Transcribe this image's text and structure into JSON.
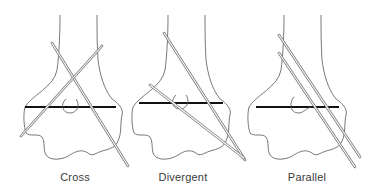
{
  "panels": [
    {
      "id": "cross",
      "label": "Cross",
      "label_x": 75
    },
    {
      "id": "divergent",
      "label": "Divergent",
      "label_x": 183
    },
    {
      "id": "parallel",
      "label": "Parallel",
      "label_x": 307
    }
  ],
  "colors": {
    "outline": "#555555",
    "bar": "#111111",
    "wire": "#777777",
    "label": "#3a3a3a",
    "background": "#ffffff"
  }
}
